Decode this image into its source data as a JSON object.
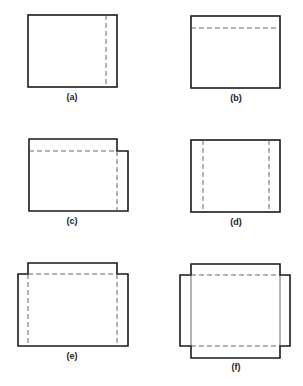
{
  "figures": [
    {
      "id": "a",
      "label": "(a)",
      "description": "rectangle with one dashed vertical fold line near right edge"
    },
    {
      "id": "b",
      "label": "(b)",
      "description": "rectangle with one dashed horizontal fold line near top edge"
    },
    {
      "id": "c",
      "label": "(c)",
      "description": "rectangle with top flap and right flap, dashed fold lines"
    },
    {
      "id": "d",
      "label": "(d)",
      "description": "rectangle with dashed vertical fold lines near both left and right edges"
    },
    {
      "id": "e",
      "label": "(e)",
      "description": "rectangle with top flap and left/right flaps, dashed fold lines"
    },
    {
      "id": "f",
      "label": "(f)",
      "description": "cross-shaped net with top, bottom, left and right flaps"
    }
  ],
  "colors": {
    "line": "#1a1a1a",
    "dash": "#555555",
    "background": "#ffffff"
  }
}
